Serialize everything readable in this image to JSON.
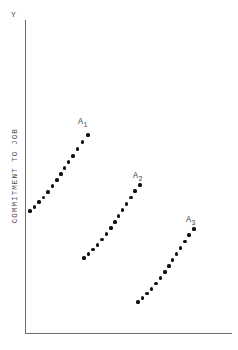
{
  "figure": {
    "background_color": "#ffffff",
    "axis_color": "#6e6e6e",
    "dot_color": "#111111"
  },
  "axes": {
    "y_axis_name": "Y",
    "y_axis_title": "COMMITMENT TO JOB"
  },
  "labels": {
    "a1": {
      "base": "A",
      "sub": "1"
    },
    "a2": {
      "base": "A",
      "sub": "2"
    },
    "a3": {
      "base": "A",
      "sub": "3"
    }
  },
  "chart_data": {
    "type": "scatter",
    "title": "",
    "subtitle": "",
    "xlabel": "",
    "ylabel": "COMMITMENT TO JOB",
    "grid": false,
    "legend": "inline-annotations",
    "axis_origin_px": [
      25,
      333
    ],
    "axis_extent_px": {
      "x_right": 232,
      "y_top": 20
    },
    "annotations": [
      {
        "text": "A1",
        "display": "A₁",
        "px": [
          78,
          118
        ]
      },
      {
        "text": "A2",
        "display": "A₂",
        "px": [
          133,
          172
        ]
      },
      {
        "text": "A3",
        "display": "A₃",
        "px": [
          186,
          216
        ]
      }
    ],
    "series": [
      {
        "name": "A1",
        "display_name": "A₁",
        "marker": "filled-circle",
        "color": "#111111",
        "n_points": 14,
        "points_px": [
          [
            30,
            211
          ],
          [
            34.5,
            207
          ],
          [
            39,
            202
          ],
          [
            43.5,
            197.5
          ],
          [
            48,
            192
          ],
          [
            52.5,
            186
          ],
          [
            57,
            180
          ],
          [
            61,
            174
          ],
          [
            64.5,
            168
          ],
          [
            68.5,
            162
          ],
          [
            73,
            156
          ],
          [
            77.5,
            149
          ],
          [
            82.5,
            142
          ],
          [
            88,
            135
          ]
        ]
      },
      {
        "name": "A2",
        "display_name": "A₂",
        "marker": "filled-circle",
        "color": "#111111",
        "n_points": 14,
        "points_px": [
          [
            84,
            258
          ],
          [
            88.5,
            254
          ],
          [
            93,
            249.5
          ],
          [
            97.5,
            245
          ],
          [
            102,
            239.5
          ],
          [
            106.5,
            234
          ],
          [
            111,
            228
          ],
          [
            115,
            222
          ],
          [
            118.5,
            216
          ],
          [
            122.5,
            210
          ],
          [
            126.5,
            204
          ],
          [
            131,
            197.5
          ],
          [
            135,
            191
          ],
          [
            140,
            185
          ]
        ]
      },
      {
        "name": "A3",
        "display_name": "A₃",
        "marker": "filled-circle",
        "color": "#111111",
        "n_points": 14,
        "points_px": [
          [
            138,
            302
          ],
          [
            142.5,
            298
          ],
          [
            147,
            293.5
          ],
          [
            151.5,
            289
          ],
          [
            156,
            283.5
          ],
          [
            160.5,
            278
          ],
          [
            165,
            272
          ],
          [
            169,
            266
          ],
          [
            172.5,
            260
          ],
          [
            176.5,
            254
          ],
          [
            180.5,
            248
          ],
          [
            185,
            241.5
          ],
          [
            189,
            235
          ],
          [
            194,
            229
          ]
        ]
      }
    ]
  }
}
